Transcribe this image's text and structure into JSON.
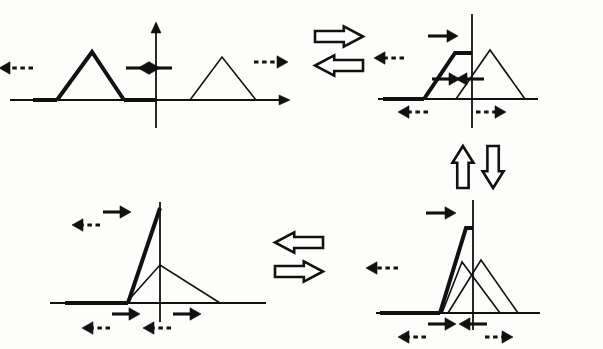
{
  "figure": {
    "type": "diagram",
    "width": 603,
    "height": 349,
    "background_color": "#fdfdfb",
    "ink_color": "#111111",
    "bold_stroke_width": 4,
    "thin_stroke_width": 1.6,
    "axis_stroke_width": 1.8
  },
  "panels": [
    {
      "id": "panel-top-left",
      "name": "before-collision",
      "position": {
        "x": 0,
        "y": 0,
        "width": 300,
        "height": 140
      },
      "axis": {
        "baseline_y": 100,
        "baseline_x_start": 10,
        "baseline_x_end": 290,
        "y_axis_x": 156,
        "y_axis_top": 22,
        "y_axis_bottom": 128,
        "has_x_arrowhead": true,
        "has_y_arrowhead": true
      },
      "pulses": [
        {
          "id": "pulse-bold-left",
          "emphasis": "bold",
          "left_foot_x": 57,
          "apex_x": 92,
          "apex_y": 52,
          "right_foot_x": 124,
          "flat_top": false
        },
        {
          "id": "pulse-thin-right",
          "emphasis": "thin",
          "left_foot_x": 190,
          "apex_x": 222,
          "apex_y": 57,
          "right_foot_x": 256,
          "flat_top": false
        }
      ],
      "bold_baseline_segments": [
        {
          "x_start": 33,
          "x_end": 57
        },
        {
          "x_start": 124,
          "x_end": 157
        }
      ],
      "motion_arrows": [
        {
          "id": "arrow-tl-1",
          "x": 33,
          "y": 68,
          "length": 34,
          "direction": "left",
          "style": "dashed",
          "weight": "bold"
        },
        {
          "id": "arrow-tl-2",
          "x": 126,
          "y": 68,
          "length": 34,
          "direction": "right",
          "style": "solid",
          "weight": "bold"
        },
        {
          "id": "arrow-tl-3",
          "x": 172,
          "y": 68,
          "length": 34,
          "direction": "left",
          "style": "solid",
          "weight": "bold"
        },
        {
          "id": "arrow-tl-4",
          "x": 254,
          "y": 62,
          "length": 34,
          "direction": "right",
          "style": "dashed",
          "weight": "bold"
        }
      ]
    },
    {
      "id": "panel-top-right",
      "name": "partial-overlap-symmetric",
      "position": {
        "x": 370,
        "y": 0,
        "width": 233,
        "height": 140
      },
      "axis": {
        "baseline_y": 99,
        "baseline_x_start": 8,
        "baseline_x_end": 168,
        "y_axis_x": 102,
        "y_axis_top": 14,
        "y_axis_bottom": 128,
        "has_x_arrowhead": false,
        "has_y_arrowhead": false
      },
      "pulses": [
        {
          "id": "pulse-bold-overlap",
          "emphasis": "bold",
          "left_foot_x": 54,
          "apex_x": 85,
          "apex_y": 53,
          "right_foot_x": 118,
          "flat_top": true,
          "flat_top_x_end": 102
        },
        {
          "id": "pulse-thin-overlap",
          "emphasis": "thin",
          "left_foot_x": 86,
          "apex_x": 120,
          "apex_y": 50,
          "right_foot_x": 155,
          "flat_top": false
        }
      ],
      "bold_baseline_segments": [
        {
          "x_start": 13,
          "x_end": 54
        }
      ],
      "motion_arrows": [
        {
          "id": "arrow-tr-1",
          "x": 58,
          "y": 36,
          "length": 30,
          "direction": "right",
          "style": "solid",
          "weight": "bold"
        },
        {
          "id": "arrow-tr-2",
          "x": 34,
          "y": 58,
          "length": 30,
          "direction": "left",
          "style": "dashed",
          "weight": "bold"
        },
        {
          "id": "arrow-tr-3",
          "x": 62,
          "y": 79,
          "length": 28,
          "direction": "right",
          "style": "solid",
          "weight": "bold"
        },
        {
          "id": "arrow-tr-4",
          "x": 114,
          "y": 79,
          "length": 28,
          "direction": "left",
          "style": "solid",
          "weight": "bold"
        },
        {
          "id": "arrow-tr-5",
          "x": 58,
          "y": 112,
          "length": 30,
          "direction": "left",
          "style": "dashed",
          "weight": "bold"
        },
        {
          "id": "arrow-tr-6",
          "x": 106,
          "y": 112,
          "length": 30,
          "direction": "right",
          "style": "dashed",
          "weight": "bold"
        }
      ]
    },
    {
      "id": "panel-bottom-left",
      "name": "full-overlap-peak",
      "position": {
        "x": 40,
        "y": 190,
        "width": 260,
        "height": 159
      },
      "axis": {
        "baseline_y": 113,
        "baseline_x_start": 10,
        "baseline_x_end": 226,
        "y_axis_x": 120,
        "y_axis_top": 12,
        "y_axis_bottom": 132,
        "has_x_arrowhead": false,
        "has_y_arrowhead": false
      },
      "pulses": [
        {
          "id": "pulse-bold-peak",
          "emphasis": "bold",
          "left_foot_x": 88,
          "apex_x": 120,
          "apex_y": 18,
          "right_foot_x": 120,
          "flat_top": false,
          "single_edge": true
        },
        {
          "id": "pulse-thin-peak",
          "emphasis": "thin",
          "left_foot_x": 86,
          "apex_x": 120,
          "apex_y": 75,
          "right_foot_x": 180,
          "flat_top": false
        }
      ],
      "bold_baseline_segments": [
        {
          "x_start": 25,
          "x_end": 88
        }
      ],
      "motion_arrows": [
        {
          "id": "arrow-bl-1",
          "x": 63,
          "y": 22,
          "length": 28,
          "direction": "right",
          "style": "solid",
          "weight": "bold"
        },
        {
          "id": "arrow-bl-2",
          "x": 60,
          "y": 35,
          "length": 28,
          "direction": "left",
          "style": "dashed",
          "weight": "bold"
        },
        {
          "id": "arrow-bl-3",
          "x": 72,
          "y": 124,
          "length": 28,
          "direction": "right",
          "style": "solid",
          "weight": "bold"
        },
        {
          "id": "arrow-bl-4",
          "x": 70,
          "y": 138,
          "length": 28,
          "direction": "left",
          "style": "dashed",
          "weight": "bold"
        },
        {
          "id": "arrow-bl-5",
          "x": 133,
          "y": 124,
          "length": 28,
          "direction": "right",
          "style": "solid",
          "weight": "bold"
        },
        {
          "id": "arrow-bl-6",
          "x": 131,
          "y": 138,
          "length": 28,
          "direction": "left",
          "style": "dashed",
          "weight": "bold"
        }
      ]
    },
    {
      "id": "panel-bottom-right",
      "name": "partial-overlap-twin-peaks",
      "position": {
        "x": 370,
        "y": 190,
        "width": 233,
        "height": 159
      },
      "axis": {
        "baseline_y": 123,
        "baseline_x_start": 6,
        "baseline_x_end": 170,
        "y_axis_x": 103,
        "y_axis_top": 10,
        "y_axis_bottom": 140,
        "has_x_arrowhead": false,
        "has_y_arrowhead": false
      },
      "pulses": [
        {
          "id": "pulse-bold-twin",
          "emphasis": "bold",
          "left_foot_x": 70,
          "apex_x": 96,
          "apex_y": 38,
          "right_foot_x": 118,
          "flat_top": true,
          "flat_top_x_end": 103
        },
        {
          "id": "pulse-thin-twin-a",
          "emphasis": "thin",
          "left_foot_x": 72,
          "apex_x": 92,
          "apex_y": 72,
          "right_foot_x": 130,
          "flat_top": false
        },
        {
          "id": "pulse-thin-twin-b",
          "emphasis": "thin",
          "left_foot_x": 78,
          "apex_x": 111,
          "apex_y": 70,
          "right_foot_x": 148,
          "flat_top": false
        }
      ],
      "bold_baseline_segments": [
        {
          "x_start": 10,
          "x_end": 70
        }
      ],
      "motion_arrows": [
        {
          "id": "arrow-br-1",
          "x": 56,
          "y": 23,
          "length": 30,
          "direction": "right",
          "style": "solid",
          "weight": "bold"
        },
        {
          "id": "arrow-br-2",
          "x": 28,
          "y": 78,
          "length": 32,
          "direction": "left",
          "style": "dashed",
          "weight": "bold"
        },
        {
          "id": "arrow-br-3",
          "x": 58,
          "y": 134,
          "length": 28,
          "direction": "right",
          "style": "solid",
          "weight": "bold"
        },
        {
          "id": "arrow-br-4",
          "x": 56,
          "y": 147,
          "length": 28,
          "direction": "left",
          "style": "dashed",
          "weight": "bold"
        },
        {
          "id": "arrow-br-5",
          "x": 117,
          "y": 134,
          "length": 28,
          "direction": "left",
          "style": "solid",
          "weight": "bold"
        },
        {
          "id": "arrow-br-6",
          "x": 115,
          "y": 147,
          "length": 28,
          "direction": "right",
          "style": "dashed",
          "weight": "bold"
        }
      ]
    }
  ],
  "transitions": [
    {
      "id": "transition-top",
      "name": "top-horizontal-double-arrow",
      "orientation": "horizontal",
      "position": {
        "x": 315,
        "y": 26
      },
      "size": {
        "width": 48,
        "height": 50
      },
      "arrows": [
        {
          "direction": "right",
          "row": "top"
        },
        {
          "direction": "left",
          "row": "bottom"
        }
      ]
    },
    {
      "id": "transition-right",
      "name": "right-vertical-double-arrow",
      "orientation": "vertical",
      "position": {
        "x": 452,
        "y": 146
      },
      "size": {
        "width": 52,
        "height": 42
      },
      "arrows": [
        {
          "direction": "up",
          "column": "left"
        },
        {
          "direction": "down",
          "column": "right"
        }
      ]
    },
    {
      "id": "transition-bottom",
      "name": "bottom-horizontal-double-arrow",
      "orientation": "horizontal",
      "position": {
        "x": 275,
        "y": 232
      },
      "size": {
        "width": 48,
        "height": 50
      },
      "arrows": [
        {
          "direction": "left",
          "row": "top"
        },
        {
          "direction": "right",
          "row": "bottom"
        }
      ]
    }
  ]
}
